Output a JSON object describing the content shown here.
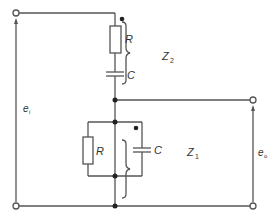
{
  "diagram": {
    "type": "circuit",
    "labels": {
      "input_voltage": "e",
      "input_sub": "i",
      "output_voltage": "e",
      "output_sub": "o",
      "z2": "Z",
      "z2_sub": "2",
      "z1": "Z",
      "z1_sub": "1",
      "top_resistor": "R",
      "top_capacitor": "C",
      "bottom_resistor": "R",
      "bottom_capacitor": "C"
    },
    "colors": {
      "wire": "#555555",
      "background": "#ffffff",
      "text": "#333333"
    }
  }
}
